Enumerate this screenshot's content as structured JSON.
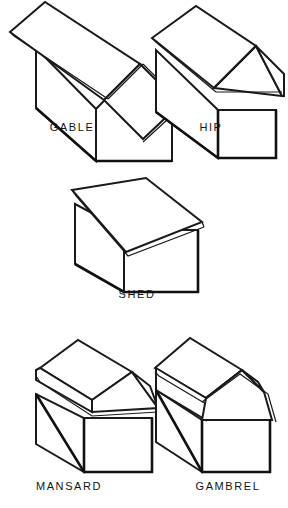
{
  "figure": {
    "background_color": "#ffffff",
    "line_color": "#1a1a1a",
    "face_color": "#ffffff",
    "label_color": "#141414"
  },
  "diagram_type": "isometric-line-drawing",
  "labels": {
    "gable": "GABLE",
    "hip": "HIP",
    "shed": "SHED",
    "mansard": "MANSARD",
    "gambrel": "GAMBREL"
  },
  "caption": {
    "partial_text": ""
  },
  "items": [
    {
      "name": "gable",
      "label": "GABLE",
      "row": 1,
      "column": 1,
      "description": "Two sloping planes meeting at a central ridge with vertical gable end wall"
    },
    {
      "name": "hip",
      "label": "HIP",
      "row": 1,
      "column": 2,
      "description": "Roof sloping on all sides with triangular hip end panel"
    },
    {
      "name": "shed",
      "label": "SHED",
      "row": 2,
      "column": 1,
      "description": "Single flat plane sloping in one direction"
    },
    {
      "name": "mansard",
      "label": "MANSARD",
      "row": 3,
      "column": 1,
      "description": "Steep lower slopes on all sides with flatter upper deck"
    },
    {
      "name": "gambrel",
      "label": "GAMBREL",
      "row": 3,
      "column": 2,
      "description": "Barn style roof with two different pitches on each side"
    }
  ]
}
